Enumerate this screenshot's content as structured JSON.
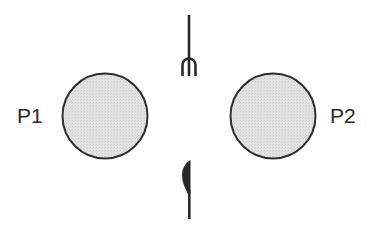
{
  "diagram": {
    "type": "seating-layout",
    "colors": {
      "plate_fill": "#dcdcdc",
      "plate_stroke": "#2e2e2e",
      "utensil": "#2a2a2a",
      "text": "#2a2a2a",
      "background": "#ffffff"
    },
    "players": [
      {
        "id": "p1",
        "label": "P1",
        "position": "left"
      },
      {
        "id": "p2",
        "label": "P2",
        "position": "right"
      }
    ],
    "utensils": [
      {
        "id": "fork",
        "icon": "fork-icon",
        "position": "top-center"
      },
      {
        "id": "knife",
        "icon": "knife-icon",
        "position": "bottom-center"
      }
    ]
  }
}
